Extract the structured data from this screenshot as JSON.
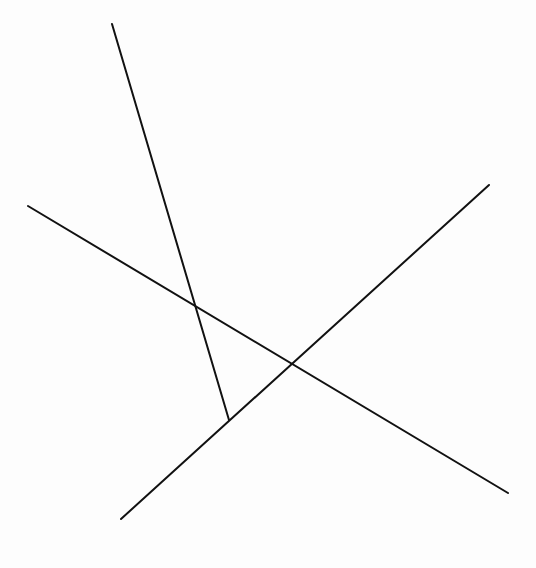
{
  "diagram": {
    "width": 536,
    "height": 568,
    "background": "#fdfdfd",
    "stroke_color": "#111111",
    "stroke_width": 2,
    "lines": [
      {
        "id": "line-a",
        "x1": 112,
        "y1": 24,
        "x2": 229,
        "y2": 420
      },
      {
        "id": "line-b",
        "x1": 28,
        "y1": 206,
        "x2": 508,
        "y2": 493
      },
      {
        "id": "line-c",
        "x1": 121,
        "y1": 519,
        "x2": 489,
        "y2": 185
      }
    ],
    "intersections": [
      {
        "between": [
          "line-a",
          "line-b"
        ],
        "x": 195,
        "y": 306
      },
      {
        "between": [
          "line-b",
          "line-c"
        ],
        "x": 291,
        "y": 364
      },
      {
        "between": [
          "line-a",
          "line-c"
        ],
        "x": 229,
        "y": 420
      }
    ]
  }
}
